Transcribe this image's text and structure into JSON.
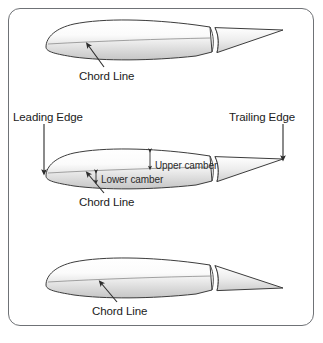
{
  "figure": {
    "border_color": "#6f7276",
    "background": "#ffffff",
    "ink_color": "#1b1b1b"
  },
  "labels": {
    "chord_line_top": "Chord Line",
    "chord_line_middle": "Chord Line",
    "chord_line_bottom": "Chord Line",
    "leading_edge": "Leading Edge",
    "trailing_edge": "Trailing Edge",
    "upper_camber": "Upper camber",
    "lower_camber": "Lower camber"
  },
  "airfoils": [
    {
      "name": "airfoil-top",
      "annotations": [
        "Chord Line"
      ]
    },
    {
      "name": "airfoil-middle",
      "annotations": [
        "Leading Edge",
        "Trailing Edge",
        "Upper camber",
        "Lower camber",
        "Chord Line"
      ]
    },
    {
      "name": "airfoil-bottom",
      "annotations": [
        "Chord Line"
      ]
    }
  ],
  "icons": {
    "pointer_arrow": "arrow-pointer-icon",
    "down_arrow": "arrow-down-icon",
    "double_arrow": "double-headed-arrow-icon"
  }
}
